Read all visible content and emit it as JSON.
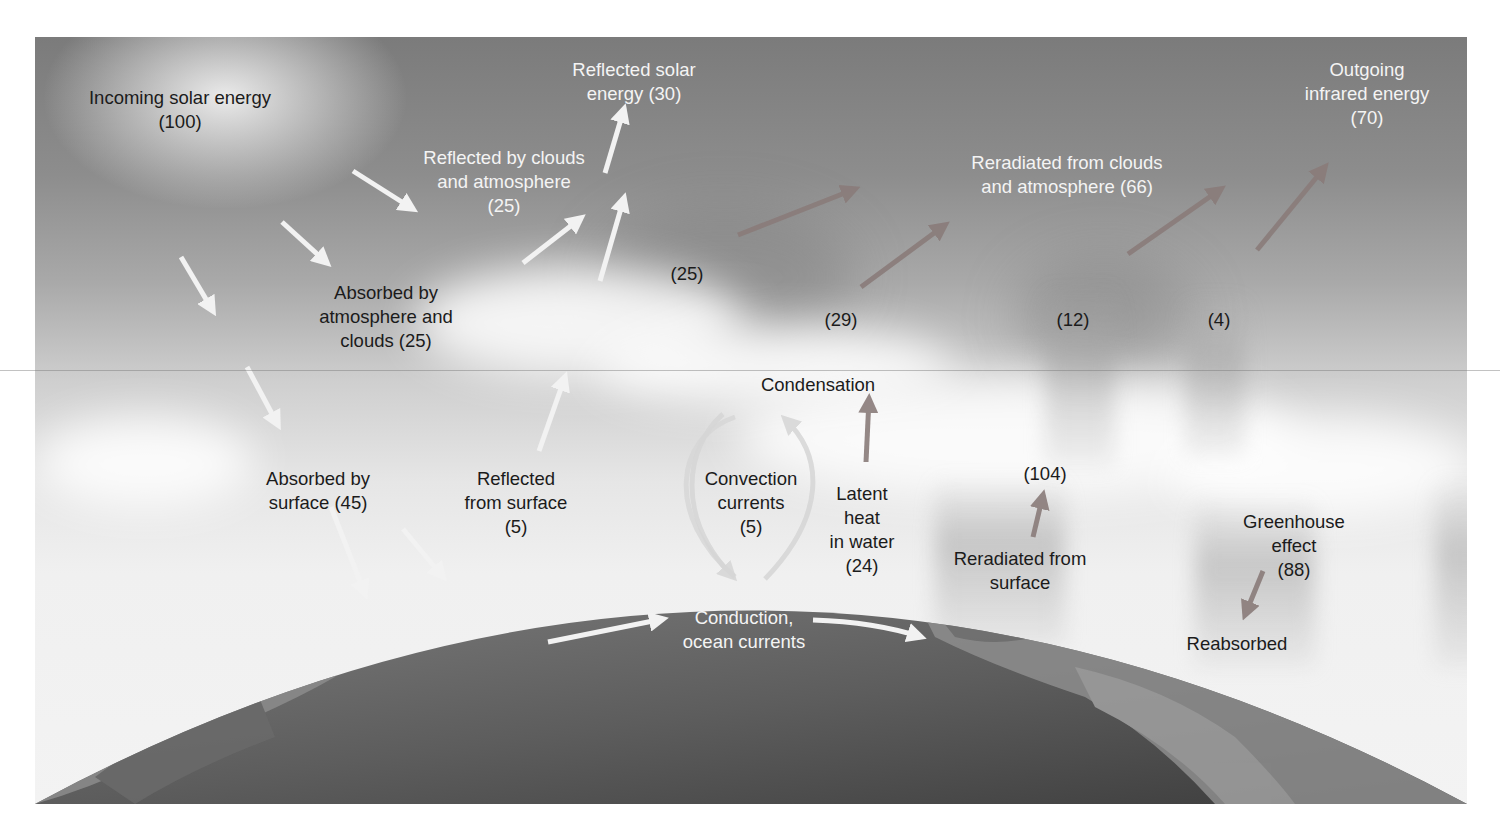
{
  "diagram": {
    "labels": {
      "incoming_solar": "Incoming solar energy\n(100)",
      "reflected_solar": "Reflected solar\nenergy (30)",
      "outgoing_infrared": "Outgoing\ninfrared energy\n(70)",
      "reflected_clouds": "Reflected by clouds\nand atmosphere\n(25)",
      "reradiated_clouds": "Reradiated from clouds\nand atmosphere (66)",
      "absorbed_atmosphere": "Absorbed by\natmosphere and\nclouds (25)",
      "value_25": "(25)",
      "value_29": "(29)",
      "value_12": "(12)",
      "value_4": "(4)",
      "condensation": "Condensation",
      "absorbed_surface": "Absorbed by\nsurface (45)",
      "reflected_surface": "Reflected\nfrom surface\n(5)",
      "convection": "Convection\ncurrents\n(5)",
      "latent_heat": "Latent\nheat\nin water\n(24)",
      "value_104": "(104)",
      "reradiated_surface": "Reradiated from\nsurface",
      "greenhouse": "Greenhouse\neffect\n(88)",
      "reabsorbed": "Reabsorbed",
      "conduction": "Conduction,\nocean currents"
    },
    "colors": {
      "solar_arrow": "#f2f2f2",
      "infrared_arrow": "#8a7c7a",
      "convection_loop": "#d6d6d6",
      "earth_ocean": "#5e5e5e",
      "earth_land": "#8a8a8a"
    },
    "flows": [
      {
        "name": "Incoming solar energy",
        "value": 100
      },
      {
        "name": "Reflected solar energy",
        "value": 30
      },
      {
        "name": "Reflected by clouds and atmosphere",
        "value": 25
      },
      {
        "name": "Reflected from surface",
        "value": 5
      },
      {
        "name": "Absorbed by atmosphere and clouds",
        "value": 25
      },
      {
        "name": "Absorbed by surface",
        "value": 45
      },
      {
        "name": "Convection currents",
        "value": 5
      },
      {
        "name": "Latent heat in water",
        "value": 24
      },
      {
        "name": "Reradiated from surface",
        "value": 104
      },
      {
        "name": "Greenhouse effect",
        "value": 88
      },
      {
        "name": "Outgoing infrared energy",
        "value": 70
      },
      {
        "name": "Reradiated from clouds and atmosphere",
        "value": 66
      },
      {
        "name": "Infrared component a",
        "value": 25
      },
      {
        "name": "Infrared component b",
        "value": 29
      },
      {
        "name": "Infrared component c",
        "value": 12
      },
      {
        "name": "Infrared component d",
        "value": 4
      }
    ]
  }
}
